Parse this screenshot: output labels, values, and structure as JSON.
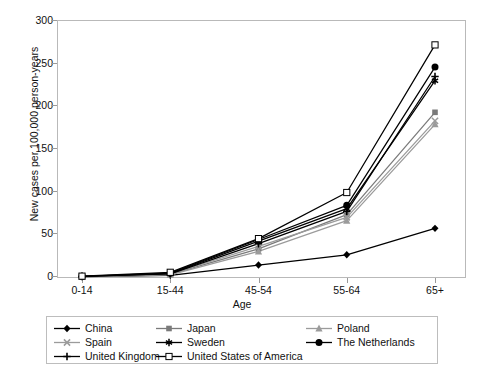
{
  "chart_data": {
    "type": "line",
    "title": "",
    "xlabel": "Age",
    "ylabel": "New cases per 100,000 person-years",
    "categories": [
      "0-14",
      "15-44",
      "45-54",
      "55-64",
      "65+"
    ],
    "ylim": [
      0,
      300
    ],
    "yticks": [
      0,
      50,
      100,
      150,
      200,
      250,
      300
    ],
    "grid": false,
    "legend_position": "below",
    "series": [
      {
        "name": "China",
        "marker": "filled-diamond",
        "color": "#000000",
        "values": [
          0.4,
          2.0,
          14.0,
          26.0,
          57.0
        ]
      },
      {
        "name": "Japan",
        "marker": "filled-square",
        "color": "#7a7a7a",
        "values": [
          0.5,
          3.0,
          33.0,
          73.0,
          193.0
        ]
      },
      {
        "name": "Poland",
        "marker": "filled-triangle",
        "color": "#9b9b9b",
        "values": [
          0.5,
          2.5,
          30.0,
          66.0,
          179.0
        ]
      },
      {
        "name": "Spain",
        "marker": "cross-x",
        "color": "#9b9b9b",
        "values": [
          0.6,
          3.5,
          36.0,
          70.0,
          183.0
        ]
      },
      {
        "name": "Sweden",
        "marker": "asterisk",
        "color": "#000000",
        "values": [
          0.8,
          4.0,
          42.0,
          80.0,
          230.0
        ]
      },
      {
        "name": "The Netherlands",
        "marker": "filled-circle",
        "color": "#000000",
        "values": [
          0.7,
          4.5,
          44.0,
          84.0,
          246.0
        ]
      },
      {
        "name": "United Kingdom",
        "marker": "plus",
        "color": "#000000",
        "values": [
          0.6,
          3.8,
          39.0,
          77.0,
          235.0
        ]
      },
      {
        "name": "United States of America",
        "marker": "open-square",
        "color": "#000000",
        "values": [
          1.0,
          5.5,
          45.0,
          99.0,
          272.0
        ]
      }
    ]
  },
  "legend": {
    "rows": [
      [
        "China",
        "Japan",
        "Poland"
      ],
      [
        "Spain",
        "Sweden",
        "The Netherlands"
      ],
      [
        "United Kingdom",
        "United States of America"
      ]
    ]
  }
}
